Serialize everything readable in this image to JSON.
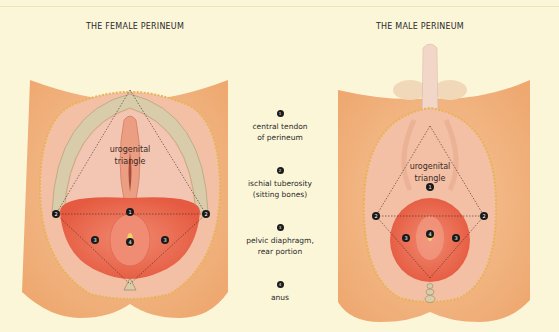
{
  "titles": {
    "female": "THE FEMALE PERINEUM",
    "male": "THE MALE PERINEUM"
  },
  "diagram_labels": {
    "female_triangle_line1": "urogenital",
    "female_triangle_line2": "triangle",
    "male_triangle_line1": "urogenital",
    "male_triangle_line2": "triangle"
  },
  "legend": [
    {
      "number": "1",
      "line1": "central tendon",
      "line2": "of perineum"
    },
    {
      "number": "2",
      "line1": "ischial tuberosity",
      "line2": "(sitting bones)"
    },
    {
      "number": "3",
      "line1": "pelvic diaphragm,",
      "line2": "rear portion"
    },
    {
      "number": "4",
      "line1": "anus",
      "line2": ""
    }
  ],
  "markers": {
    "central_tendon": "1",
    "ischial": "2",
    "pelvic": "3",
    "anus": "4"
  },
  "colors": {
    "background": "#fcf6d9",
    "skin": "#f2b27a",
    "muscle": "#e8624a",
    "fascia": "#f4c9b8",
    "bone": "#d8ccaa",
    "marker": "#1a1a1a"
  }
}
